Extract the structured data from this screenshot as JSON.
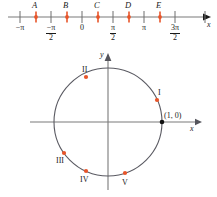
{
  "figure": {
    "colors": {
      "point_red": "#e8552a",
      "axis_gray": "#6e6e6e",
      "circle_gray": "#5a5a62",
      "text": "#1a1a1a",
      "origin_black": "#111111",
      "background": "#ffffff"
    }
  },
  "number_line": {
    "axis_label": "x",
    "ticks": [
      {
        "id": "tick-neg-pi",
        "x": 20,
        "label_html": "−π",
        "value": "-pi"
      },
      {
        "id": "tick-neg-pi-half",
        "x": 51,
        "label_html": "−π/2",
        "value": "-pi/2"
      },
      {
        "id": "tick-zero",
        "x": 82,
        "label_html": "0",
        "value": "0"
      },
      {
        "id": "tick-pi-half",
        "x": 113,
        "label_html": "π/2",
        "value": "pi/2"
      },
      {
        "id": "tick-pi",
        "x": 144,
        "label_html": "π",
        "value": "pi"
      },
      {
        "id": "tick-3pi-half",
        "x": 175,
        "label_html": "3π/2",
        "value": "3pi/2"
      },
      {
        "id": "tick-unlabeled",
        "x": 205,
        "label_html": "",
        "value": ""
      }
    ],
    "tick_labels": {
      "neg_pi": "−π",
      "neg_pi_over_2_numerator": "−π",
      "neg_pi_over_2_denominator": "2",
      "zero": "0",
      "pi_over_2_numerator": "π",
      "pi_over_2_denominator": "2",
      "pi": "π",
      "three_pi_over_2_numerator": "3π",
      "three_pi_over_2_denominator": "2"
    },
    "points": [
      {
        "id": "point-A",
        "label": "A",
        "x": 36,
        "approx_value": "-3pi/4"
      },
      {
        "id": "point-B",
        "label": "B",
        "x": 67,
        "approx_value": "-pi/4"
      },
      {
        "id": "point-C",
        "label": "C",
        "x": 98,
        "approx_value": "pi/4"
      },
      {
        "id": "point-D",
        "label": "D",
        "x": 129,
        "approx_value": "3pi/4"
      },
      {
        "id": "point-E",
        "label": "E",
        "x": 160,
        "approx_value": "5pi/4"
      }
    ]
  },
  "unit_circle": {
    "x_axis_label": "x",
    "y_axis_label": "y",
    "center": {
      "x": 108,
      "y": 122
    },
    "radius": 54,
    "origin_point_label": "(1, 0)",
    "points": [
      {
        "id": "circle-point-I",
        "label": "I",
        "x": 152,
        "y": 100,
        "angle_deg": 24,
        "quadrant": 1
      },
      {
        "id": "circle-point-II",
        "label": "II",
        "x": 86,
        "y": 77,
        "angle_deg": 114,
        "quadrant": 2
      },
      {
        "id": "circle-point-III",
        "label": "III",
        "x": 64,
        "y": 153,
        "angle_deg": 215,
        "quadrant": 3
      },
      {
        "id": "circle-point-IV",
        "label": "IV",
        "x": 86,
        "y": 169,
        "angle_deg": 245,
        "quadrant": 3
      },
      {
        "id": "circle-point-V",
        "label": "V",
        "x": 125,
        "y": 173,
        "angle_deg": 290,
        "quadrant": 4
      }
    ]
  }
}
